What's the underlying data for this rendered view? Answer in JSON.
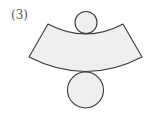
{
  "figure": {
    "label": "(3)",
    "parts": [
      "top-circle",
      "lateral-surface-sector",
      "bottom-circle"
    ],
    "colors": {
      "stroke": "#3a3a3a",
      "fill": "#efefef"
    }
  }
}
